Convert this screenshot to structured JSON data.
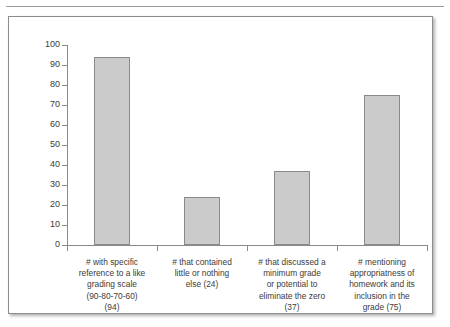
{
  "chart_data": {
    "type": "bar",
    "title": "",
    "subtitle": "",
    "xlabel": "",
    "ylabel": "",
    "ylim": [
      0,
      100
    ],
    "yticks": [
      0,
      10,
      20,
      30,
      40,
      50,
      60,
      70,
      80,
      90,
      100
    ],
    "grid": false,
    "legend": false,
    "legend_position": "none",
    "categories": [
      "# with specific reference to a like grading scale (90-80-70-60) (94)",
      "# that contained little or nothing else (24)",
      "# that discussed a minimum grade or potential to eliminate the zero (37)",
      "# mentioning appropriatness of homework and its inclusion in the grade (75)"
    ],
    "category_lines": [
      [
        "# with specific",
        "reference to a like",
        "grading scale",
        "(90-80-70-60)",
        "(94)"
      ],
      [
        "# that contained",
        "little or nothing",
        "else (24)"
      ],
      [
        "# that discussed a",
        "minimum grade",
        "or potential to",
        "eliminate the zero",
        "(37)"
      ],
      [
        "# mentioning",
        "appropriatness of",
        "homework and its",
        "inclusion in the",
        "grade (75)"
      ]
    ],
    "values": [
      94,
      24,
      37,
      75
    ],
    "series": [
      {
        "name": "count",
        "values": [
          94,
          24,
          37,
          75
        ]
      }
    ],
    "bar_fill_color": "#cbcbcb",
    "bar_border_color": "#8a8a8a",
    "axis_color": "#8a8a8a",
    "frame_border_color": "#8c8c8c",
    "background_color": "#ffffff"
  }
}
